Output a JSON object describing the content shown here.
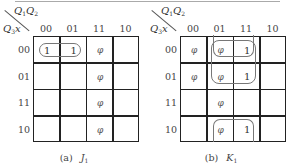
{
  "figures": [
    {
      "id": "a",
      "caption_prefix": "(a)",
      "caption_var": "J",
      "caption_sub": "1",
      "col_var": "Q1Q2",
      "row_var": "Q3x",
      "col_headers": [
        "00",
        "01",
        "11",
        "10"
      ],
      "row_headers": [
        "00",
        "01",
        "11",
        "10"
      ],
      "cells": [
        [
          "1",
          "1",
          "φ",
          ""
        ],
        [
          "",
          "",
          "φ",
          ""
        ],
        [
          "",
          "",
          "φ",
          ""
        ],
        [
          "",
          "",
          "φ",
          ""
        ]
      ],
      "loops": [
        {
          "rows": [
            0
          ],
          "cols": [
            0,
            1
          ]
        }
      ]
    },
    {
      "id": "b",
      "caption_prefix": "(b)",
      "caption_var": "K",
      "caption_sub": "1",
      "col_var": "Q1Q2",
      "row_var": "Q3x",
      "col_headers": [
        "00",
        "01",
        "11",
        "10"
      ],
      "row_headers": [
        "00",
        "01",
        "11",
        "10"
      ],
      "cells": [
        [
          "φ",
          "φ",
          "1",
          ""
        ],
        [
          "φ",
          "φ",
          "1",
          ""
        ],
        [
          "",
          "φ",
          "",
          ""
        ],
        [
          "",
          "φ",
          "1",
          ""
        ]
      ],
      "loops": [
        {
          "rows": [
            0,
            1
          ],
          "cols": [
            1,
            2
          ]
        },
        {
          "rows": [
            3,
            0
          ],
          "cols": [
            1,
            2
          ],
          "wrap": true
        }
      ]
    }
  ]
}
